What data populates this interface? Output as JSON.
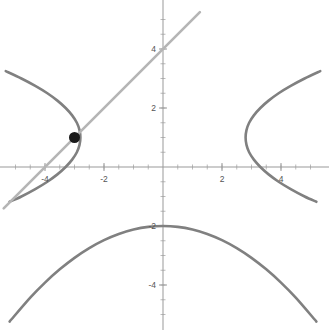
{
  "figure": {
    "title": "",
    "background_color": "#ffffff",
    "width": 329,
    "height": 330
  },
  "axes": {
    "axis_color": "#999999",
    "axis_style": "crossed-at-origin",
    "origin_px": {
      "x": 163,
      "y": 167
    },
    "pixels_per_unit": 29.5,
    "xlim": [
      -5.2,
      5.2
    ],
    "ylim": [
      -5.3,
      5.1
    ],
    "grid": false,
    "xlabel": "",
    "ylabel": "",
    "x_tick_labels": [
      "-4",
      "-2",
      "2",
      "4"
    ],
    "x_tick_values": [
      -4,
      -2,
      2,
      4
    ],
    "y_tick_labels": [
      "4",
      "2",
      "-2",
      "-4"
    ],
    "y_tick_values": [
      4,
      2,
      -2,
      -4
    ],
    "minor_tick_step": 0.5,
    "tick_color": "#aaaaaa"
  },
  "chart_data": {
    "type": "line",
    "title": "",
    "xlabel": "",
    "ylabel": "",
    "xlim": [
      -5.2,
      5.2
    ],
    "ylim": [
      -5.3,
      5.1
    ],
    "grid": false,
    "legend": "none",
    "series": [
      {
        "name": "sideways-parabola-left-branch",
        "color": "#808080",
        "width": 2.6,
        "equation": "x = -(y*y - 2*y + 1)/2 - 2.8",
        "points": [
          [
            -2.8,
            1.0
          ],
          [
            -2.83,
            0.75
          ],
          [
            -2.83,
            1.25
          ],
          [
            -2.92,
            0.5
          ],
          [
            -2.92,
            1.5
          ],
          [
            -3.08,
            0.25
          ],
          [
            -3.08,
            1.75
          ],
          [
            -3.3,
            0.0
          ],
          [
            -3.3,
            2.0
          ],
          [
            -3.58,
            -0.25
          ],
          [
            -3.58,
            2.25
          ],
          [
            -3.92,
            -0.5
          ],
          [
            -3.92,
            2.5
          ],
          [
            -4.33,
            -0.75
          ],
          [
            -4.33,
            2.75
          ],
          [
            -4.8,
            -1.0
          ],
          [
            -4.8,
            3.0
          ],
          [
            -5.2,
            -1.18
          ],
          [
            -5.33,
            3.25
          ]
        ]
      },
      {
        "name": "sideways-parabola-right-branch",
        "color": "#808080",
        "width": 2.6,
        "equation": "x = (y*y - 2*y + 1)/2 + 2.8",
        "points": [
          [
            2.8,
            1.0
          ],
          [
            2.83,
            0.75
          ],
          [
            2.83,
            1.25
          ],
          [
            2.92,
            0.5
          ],
          [
            2.92,
            1.5
          ],
          [
            3.08,
            0.25
          ],
          [
            3.08,
            1.75
          ],
          [
            3.3,
            0.0
          ],
          [
            3.3,
            2.0
          ],
          [
            3.58,
            -0.25
          ],
          [
            3.58,
            2.25
          ],
          [
            3.92,
            -0.5
          ],
          [
            3.92,
            2.5
          ],
          [
            4.33,
            -0.75
          ],
          [
            4.33,
            2.75
          ],
          [
            4.8,
            -1.0
          ],
          [
            4.8,
            3.0
          ],
          [
            5.2,
            -1.18
          ],
          [
            5.33,
            3.25
          ]
        ]
      },
      {
        "name": "downward-parabola",
        "color": "#808080",
        "width": 2.6,
        "equation": "y = -0.12*x*x - 2",
        "vertex": [
          0,
          -2
        ],
        "points": [
          [
            -5.2,
            -5.24
          ],
          [
            -4.5,
            -4.43
          ],
          [
            -4.0,
            -3.92
          ],
          [
            -3.5,
            -3.47
          ],
          [
            -3.0,
            -3.08
          ],
          [
            -2.5,
            -2.75
          ],
          [
            -2.0,
            -2.48
          ],
          [
            -1.5,
            -2.27
          ],
          [
            -1.0,
            -2.12
          ],
          [
            -0.5,
            -2.03
          ],
          [
            0.0,
            -2.0
          ],
          [
            0.5,
            -2.03
          ],
          [
            1.0,
            -2.12
          ],
          [
            1.5,
            -2.27
          ],
          [
            2.0,
            -2.48
          ],
          [
            2.5,
            -2.75
          ],
          [
            3.0,
            -3.08
          ],
          [
            3.5,
            -3.47
          ],
          [
            4.0,
            -3.92
          ],
          [
            4.5,
            -4.43
          ],
          [
            5.2,
            -5.24
          ]
        ]
      },
      {
        "name": "tangent-line",
        "color": "#b5b5b5",
        "width": 2.6,
        "equation": "y = x + 4",
        "points": [
          [
            -5.4,
            -1.4
          ],
          [
            1.25,
            5.25
          ]
        ]
      }
    ],
    "points": [
      {
        "name": "intersection-point",
        "x": -3,
        "y": 1,
        "color": "#1a1a1a",
        "radius": 5.5,
        "label": ""
      }
    ]
  }
}
